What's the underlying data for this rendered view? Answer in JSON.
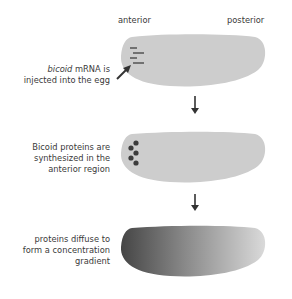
{
  "diagram": {
    "axis_labels": {
      "anterior": "anterior",
      "posterior": "posterior"
    },
    "steps": [
      {
        "id": "step-1",
        "caption_italic": "bicoid",
        "caption_line1_rest": " mRNA is",
        "caption_line2": "injected into the egg",
        "egg_fill": "#cdcdcd",
        "marker": "mRNA dashes"
      },
      {
        "id": "step-2",
        "caption_lines": [
          "Bicoid proteins are",
          "synthesized in the",
          "anterior region"
        ],
        "egg_fill": "#cdcdcd",
        "marker": "protein dots"
      },
      {
        "id": "step-3",
        "caption_lines": [
          "proteins diffuse to",
          "form a concentration",
          "gradient"
        ],
        "egg_fill_gradient": [
          "#4a4a4a",
          "#d6d6d6"
        ],
        "marker": "concentration gradient"
      }
    ],
    "colors": {
      "egg": "#cdcdcd",
      "marks": "#3c3c3c",
      "arrow": "#333333"
    }
  }
}
